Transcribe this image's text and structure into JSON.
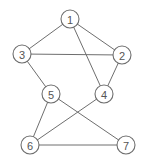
{
  "diagram": {
    "type": "undirected-graph",
    "colors": {
      "background": "#ffffff",
      "stroke": "#6e6e6e",
      "label": "#555555"
    },
    "node_radius": 9,
    "nodes": [
      {
        "id": "1",
        "label": "1",
        "x": 70,
        "y": 19
      },
      {
        "id": "2",
        "label": "2",
        "x": 122,
        "y": 55
      },
      {
        "id": "3",
        "label": "3",
        "x": 22,
        "y": 54
      },
      {
        "id": "4",
        "label": "4",
        "x": 104,
        "y": 94
      },
      {
        "id": "5",
        "label": "5",
        "x": 51,
        "y": 94
      },
      {
        "id": "6",
        "label": "6",
        "x": 30,
        "y": 145
      },
      {
        "id": "7",
        "label": "7",
        "x": 126,
        "y": 145
      }
    ],
    "edges": [
      {
        "from": "1",
        "to": "3"
      },
      {
        "from": "1",
        "to": "2"
      },
      {
        "from": "1",
        "to": "4"
      },
      {
        "from": "3",
        "to": "2"
      },
      {
        "from": "3",
        "to": "5"
      },
      {
        "from": "2",
        "to": "4"
      },
      {
        "from": "5",
        "to": "6"
      },
      {
        "from": "5",
        "to": "7"
      },
      {
        "from": "4",
        "to": "6"
      },
      {
        "from": "6",
        "to": "7"
      }
    ]
  }
}
